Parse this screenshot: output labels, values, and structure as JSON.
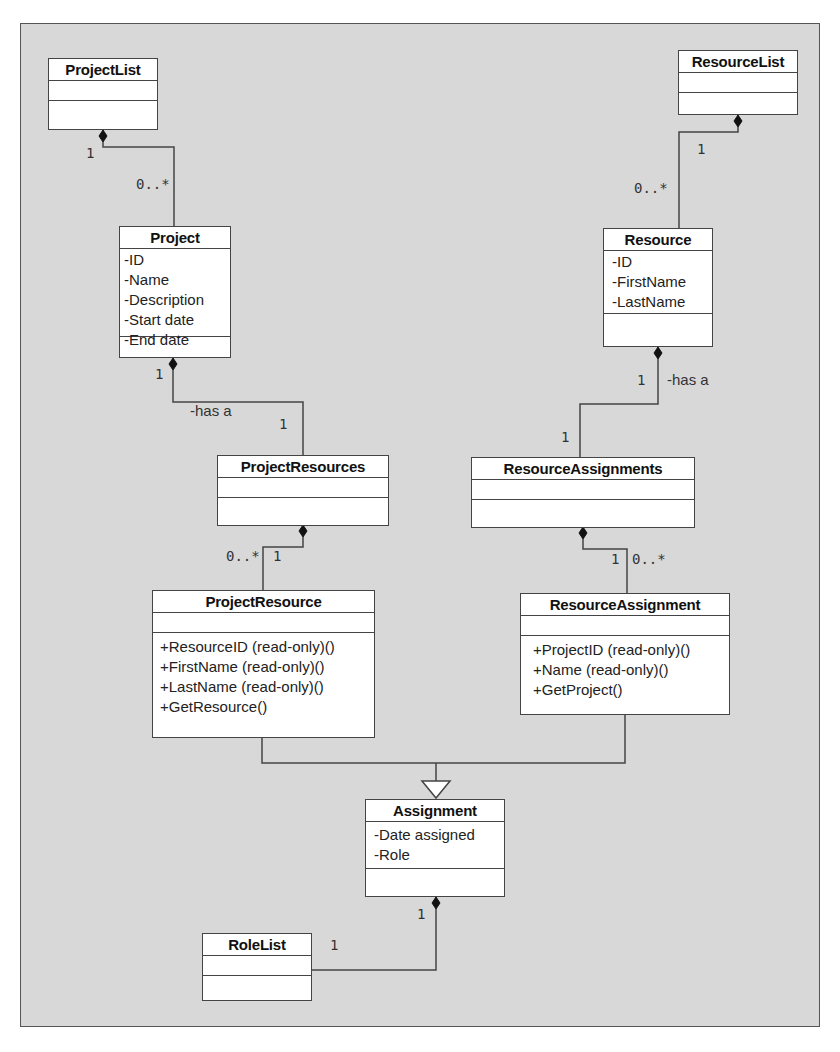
{
  "classes": {
    "project_list": {
      "name": "ProjectList",
      "attributes": [],
      "methods": []
    },
    "resource_list": {
      "name": "ResourceList",
      "attributes": [],
      "methods": []
    },
    "project": {
      "name": "Project",
      "attributes": [
        "-ID",
        "-Name",
        "-Description",
        "-Start date",
        "-End date"
      ],
      "methods": []
    },
    "resource": {
      "name": "Resource",
      "attributes": [
        "-ID",
        "-FirstName",
        "-LastName"
      ],
      "methods": []
    },
    "project_resources": {
      "name": "ProjectResources",
      "attributes": [],
      "methods": []
    },
    "resource_assignments": {
      "name": "ResourceAssignments",
      "attributes": [],
      "methods": []
    },
    "project_resource": {
      "name": "ProjectResource",
      "attributes": [],
      "methods": [
        "+ResourceID (read-only)()",
        "+FirstName (read-only)()",
        "+LastName (read-only)()",
        "+GetResource()"
      ]
    },
    "resource_assignment": {
      "name": "ResourceAssignment",
      "attributes": [],
      "methods": [
        "+ProjectID (read-only)()",
        "+Name (read-only)()",
        "+GetProject()"
      ]
    },
    "assignment": {
      "name": "Assignment",
      "attributes": [
        "-Date assigned",
        "-Role"
      ],
      "methods": []
    },
    "role_list": {
      "name": "RoleList",
      "attributes": [],
      "methods": []
    }
  },
  "relationships": [
    {
      "type": "composition",
      "from": "ProjectList",
      "to": "Project",
      "from_mult": "1",
      "to_mult": "0..*"
    },
    {
      "type": "composition",
      "from": "ResourceList",
      "to": "Resource",
      "from_mult": "1",
      "to_mult": "0..*"
    },
    {
      "type": "composition",
      "from": "Project",
      "to": "ProjectResources",
      "from_mult": "1",
      "to_mult": "1",
      "role": "-has a"
    },
    {
      "type": "composition",
      "from": "Resource",
      "to": "ResourceAssignments",
      "from_mult": "1",
      "to_mult": "1",
      "role": "-has a"
    },
    {
      "type": "composition",
      "from": "ProjectResources",
      "to": "ProjectResource",
      "from_mult": "1",
      "to_mult": "0..*"
    },
    {
      "type": "composition",
      "from": "ResourceAssignments",
      "to": "ResourceAssignment",
      "from_mult": "1",
      "to_mult": "0..*"
    },
    {
      "type": "generalization",
      "from": "ProjectResource",
      "to": "Assignment"
    },
    {
      "type": "generalization",
      "from": "ResourceAssignment",
      "to": "Assignment"
    },
    {
      "type": "composition",
      "from": "Assignment",
      "to": "RoleList",
      "from_mult": "1",
      "to_mult": "1"
    }
  ],
  "labels": {
    "pl_one": "1",
    "pl_many": "0..*",
    "rl_one": "1",
    "rl_many": "0..*",
    "proj_one": "1",
    "proj_role": "-has a",
    "prs_one": "1",
    "res_one": "1",
    "res_role": "-has a",
    "ras_one": "1",
    "prs_many": "0..*",
    "prs_one_b": "1",
    "ras_one_b": "1",
    "ras_many": "0..*",
    "asg_one": "1",
    "role_one": "1"
  }
}
